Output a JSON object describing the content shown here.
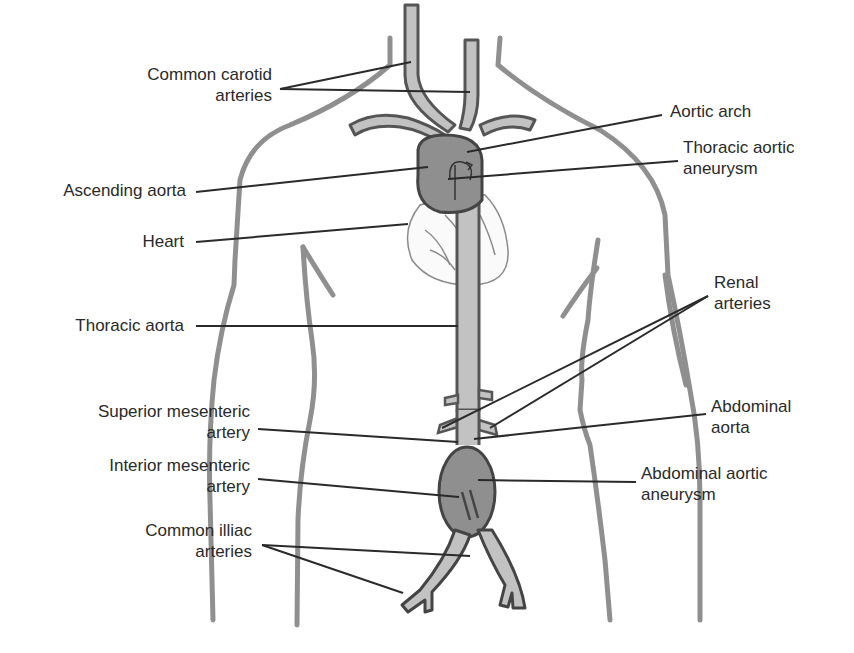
{
  "diagram": {
    "colors": {
      "outline": "#555555",
      "body_outline": "#8a8a8a",
      "vessel_fill": "#c2c2c2",
      "aneurysm_fill": "#8f8f8f",
      "leader": "#2a2a2a",
      "text": "#2a2a2a"
    },
    "labels_left": [
      {
        "id": "common-carotid",
        "line1": "Common carotid",
        "line2": "arteries"
      },
      {
        "id": "ascending-aorta",
        "line1": "Ascending aorta"
      },
      {
        "id": "heart",
        "line1": "Heart"
      },
      {
        "id": "thoracic-aorta",
        "line1": "Thoracic aorta"
      },
      {
        "id": "superior-mesenteric",
        "line1": "Superior mesenteric",
        "line2": "artery"
      },
      {
        "id": "interior-mesenteric",
        "line1": "Interior mesenteric",
        "line2": "artery"
      },
      {
        "id": "common-iliac",
        "line1": "Common illiac",
        "line2": "arteries"
      }
    ],
    "labels_right": [
      {
        "id": "aortic-arch",
        "line1": "Aortic arch"
      },
      {
        "id": "thoracic-aortic-aneurysm",
        "line1": "Thoracic aortic",
        "line2": "aneurysm"
      },
      {
        "id": "renal-arteries",
        "line1": "Renal",
        "line2": "arteries"
      },
      {
        "id": "abdominal-aorta",
        "line1": "Abdominal",
        "line2": "aorta"
      },
      {
        "id": "abdominal-aortic-aneurysm",
        "line1": "Abdominal aortic",
        "line2": "aneurysm"
      }
    ]
  }
}
